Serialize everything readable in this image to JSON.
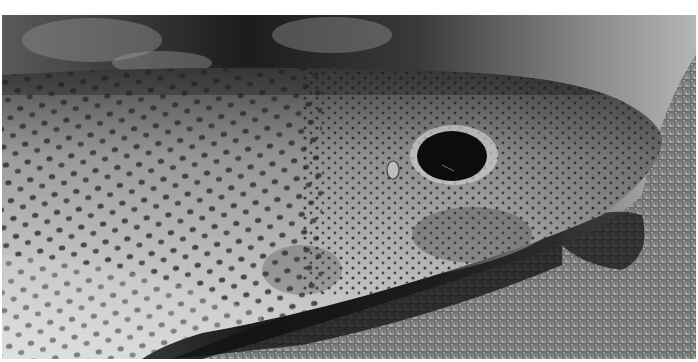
{
  "image": {
    "subject": "Small-spotted catshark resting on sandy seabed",
    "style": "grayscale photograph",
    "colors": {
      "border": "#ffffff",
      "background_dark": "#1e1e1e",
      "sand": "#9a9a9a",
      "skin_light": "#d8d8d8",
      "skin_mid": "#8c8c8c",
      "spots": "#2b2b2b",
      "eye": "#0c0c0c"
    }
  }
}
